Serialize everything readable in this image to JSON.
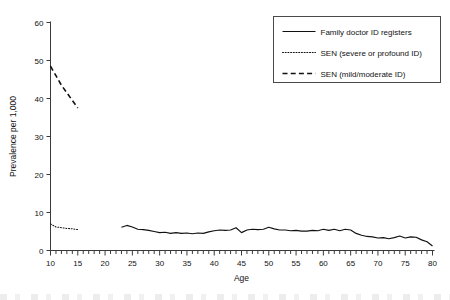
{
  "chart_data": {
    "type": "line",
    "title": "",
    "xlabel": "Age",
    "ylabel": "Prevalence per 1,000",
    "xlim": [
      10,
      80
    ],
    "ylim": [
      0,
      60
    ],
    "xticks": [
      10,
      15,
      20,
      25,
      30,
      35,
      40,
      45,
      50,
      55,
      60,
      65,
      70,
      75,
      80
    ],
    "yticks": [
      0,
      10,
      20,
      30,
      40,
      50,
      60
    ],
    "minor_xtick_step": 1,
    "grid": false,
    "legend_position": "top-right",
    "series": [
      {
        "name": "Family doctor ID registers",
        "style": "solid",
        "x": [
          23,
          24,
          25,
          26,
          27,
          28,
          29,
          30,
          31,
          32,
          33,
          34,
          35,
          36,
          37,
          38,
          39,
          40,
          41,
          42,
          43,
          44,
          45,
          46,
          47,
          48,
          49,
          50,
          51,
          52,
          53,
          54,
          55,
          56,
          57,
          58,
          59,
          60,
          61,
          62,
          63,
          64,
          65,
          66,
          67,
          68,
          69,
          70,
          71,
          72,
          73,
          74,
          75,
          76,
          77,
          78,
          79,
          80
        ],
        "values": [
          6.1,
          6.6,
          6.2,
          5.6,
          5.5,
          5.3,
          5.0,
          4.7,
          4.8,
          4.5,
          4.7,
          4.5,
          4.6,
          4.4,
          4.6,
          4.5,
          4.9,
          5.2,
          5.4,
          5.3,
          5.4,
          6.0,
          4.7,
          5.4,
          5.6,
          5.5,
          5.6,
          6.1,
          5.7,
          5.4,
          5.4,
          5.2,
          5.3,
          5.1,
          5.1,
          5.3,
          5.2,
          5.6,
          5.3,
          5.6,
          5.2,
          5.6,
          5.4,
          4.5,
          4.0,
          3.7,
          3.6,
          3.3,
          3.4,
          3.1,
          3.4,
          3.8,
          3.3,
          3.6,
          3.5,
          2.8,
          2.3,
          1.2
        ]
      },
      {
        "name": "SEN (severe or profound ID)",
        "style": "dotted",
        "x": [
          10,
          11,
          12,
          13,
          14,
          15
        ],
        "values": [
          7.0,
          6.2,
          6.0,
          5.8,
          5.7,
          5.5
        ]
      },
      {
        "name": "SEN (mild/moderate ID)",
        "style": "dashed",
        "x": [
          10,
          11,
          12,
          13,
          14,
          15
        ],
        "values": [
          48.5,
          46.0,
          43.5,
          41.5,
          39.5,
          37.5
        ]
      }
    ]
  },
  "axes": {
    "y_title": "Prevalence per 1,000",
    "x_title": "Age",
    "y_tick_labels": [
      "60",
      "50",
      "40",
      "30",
      "20",
      "10",
      "0"
    ],
    "x_tick_labels": [
      "10",
      "15",
      "20",
      "25",
      "30",
      "35",
      "40",
      "45",
      "50",
      "55",
      "60",
      "65",
      "70",
      "75",
      "80"
    ]
  },
  "legend": {
    "entries": [
      {
        "label": "Family doctor ID registers",
        "style": "solid"
      },
      {
        "label": "SEN (severe or profound ID)",
        "style": "dotted"
      },
      {
        "label": "SEN (mild/moderate ID)",
        "style": "dashed"
      }
    ]
  },
  "colors": {
    "ink": "#111111",
    "axis": "#3a3a3a",
    "background": "#ffffff"
  }
}
